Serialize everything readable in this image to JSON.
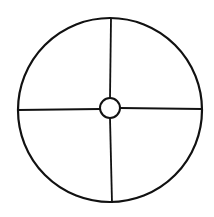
{
  "diagram": {
    "type": "circle-divided-into-quadrants",
    "stroke_color": "#111111",
    "background_color": "#ffffff",
    "outer_circle": {
      "cx": 110,
      "cy": 110,
      "r": 92,
      "stroke_width": 2.2
    },
    "inner_circle": {
      "cx": 110,
      "cy": 108,
      "r": 10,
      "stroke_width": 2
    },
    "spokes": [
      {
        "name": "top",
        "x1": 111,
        "y1": 18,
        "x2": 110,
        "y2": 98
      },
      {
        "name": "bottom",
        "x1": 110,
        "y1": 118,
        "x2": 112,
        "y2": 203
      },
      {
        "name": "left",
        "x1": 18,
        "y1": 110,
        "x2": 100,
        "y2": 109
      },
      {
        "name": "right",
        "x1": 120,
        "y1": 108,
        "x2": 202,
        "y2": 109
      }
    ]
  }
}
